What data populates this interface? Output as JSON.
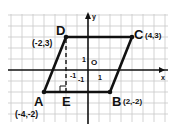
{
  "diagram": {
    "axes": {
      "x_label": "x",
      "y_label": "y",
      "origin_label": "O",
      "tick_x": "1",
      "tick_y": "1"
    },
    "points": [
      {
        "name": "A",
        "coord": "(-4,-2)",
        "x": -4,
        "y": -2
      },
      {
        "name": "B",
        "coord": "(2,-2)",
        "x": 2,
        "y": -2
      },
      {
        "name": "C",
        "coord": "(4,3)",
        "x": 4,
        "y": 3
      },
      {
        "name": "D",
        "coord": "(-2,3)",
        "x": -2,
        "y": 3
      },
      {
        "name": "E",
        "coord": "",
        "x": -2,
        "y": -2
      }
    ],
    "height_segment_labels": {
      "tick_neg": "-1",
      "tick_neg2": "-1"
    },
    "colors": {
      "grid": "#c8c8c8",
      "shape": "#111111",
      "axes": "#111111"
    }
  }
}
